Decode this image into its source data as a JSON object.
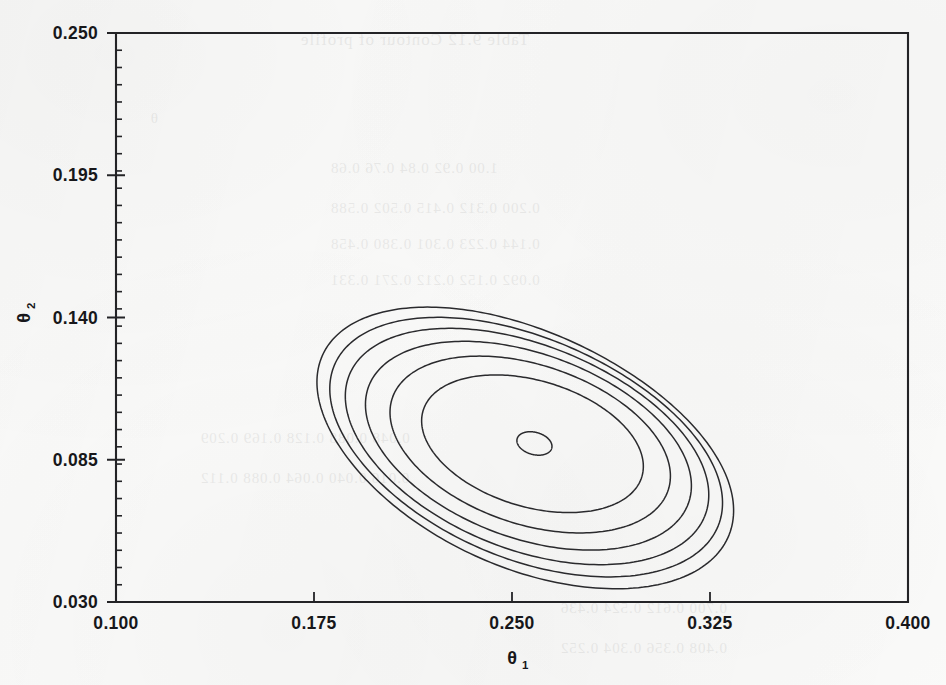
{
  "figure": {
    "kind": "contour-plot",
    "background_color": "#fbfbfa",
    "line_color": "#2a2a2d",
    "axis_color": "#232326"
  },
  "axes": {
    "x": {
      "title": "θ",
      "subscript": "1",
      "min": 0.1,
      "max": 0.4,
      "ticks": [
        "0.100",
        "0.175",
        "0.250",
        "0.325",
        "0.400"
      ],
      "tick_values": [
        0.1,
        0.175,
        0.25,
        0.325,
        0.4
      ],
      "minor_ticks": false
    },
    "y": {
      "title": "θ",
      "subscript": "2",
      "min": 0.03,
      "max": 0.25,
      "ticks": [
        "0.250",
        "0.195",
        "0.140",
        "0.085",
        "0.030"
      ],
      "tick_values": [
        0.25,
        0.195,
        0.14,
        0.085,
        0.03
      ],
      "minor_ticks": true,
      "minor_tick_count": 33
    }
  },
  "chart_data": {
    "type": "contour",
    "title": "",
    "xlabel": "θ₁",
    "ylabel": "θ₂",
    "xlim": [
      0.1,
      0.4
    ],
    "ylim": [
      0.03,
      0.25
    ],
    "grid": false,
    "legend": "none",
    "center": {
      "x": 0.258,
      "y": 0.091
    },
    "levels": [
      {
        "index": 1,
        "label": "innermost",
        "center": {
          "x": 0.2585,
          "y": 0.0913
        },
        "semi_axis_x": 0.0068,
        "semi_axis_y": 0.0043,
        "rotation_deg": -16,
        "skew": 0.0
      },
      {
        "index": 2,
        "center": {
          "x": 0.2565,
          "y": 0.092
        },
        "semi_axis_x": 0.043,
        "semi_axis_y": 0.0245,
        "rotation_deg": -16,
        "skew": 0.06
      },
      {
        "index": 3,
        "center": {
          "x": 0.2545,
          "y": 0.0925
        },
        "semi_axis_x": 0.0545,
        "semi_axis_y": 0.031,
        "rotation_deg": -17,
        "skew": 0.09
      },
      {
        "index": 4,
        "center": {
          "x": 0.2525,
          "y": 0.093
        },
        "semi_axis_x": 0.0635,
        "semi_axis_y": 0.036,
        "rotation_deg": -18,
        "skew": 0.12
      },
      {
        "index": 5,
        "center": {
          "x": 0.2505,
          "y": 0.0938
        },
        "semi_axis_x": 0.071,
        "semi_axis_y": 0.04,
        "rotation_deg": -19,
        "skew": 0.15
      },
      {
        "index": 6,
        "center": {
          "x": 0.249,
          "y": 0.0945
        },
        "semi_axis_x": 0.077,
        "semi_axis_y": 0.0432,
        "rotation_deg": -20,
        "skew": 0.17
      },
      {
        "index": 7,
        "label": "outermost",
        "center": {
          "x": 0.2475,
          "y": 0.0952
        },
        "semi_axis_x": 0.082,
        "semi_axis_y": 0.0462,
        "rotation_deg": -21,
        "skew": 0.19
      }
    ]
  },
  "bleed_through": {
    "lines": [
      {
        "text": "Table 9.12  Contour of profile",
        "x": 300,
        "y": 30,
        "size": 17
      },
      {
        "text": "θ",
        "x": 150,
        "y": 110,
        "size": 15
      },
      {
        "text": "1.00   0.92   0.84   0.76   0.68",
        "x": 330,
        "y": 160,
        "size": 15
      },
      {
        "text": "0.200  0.312  0.415  0.502  0.588",
        "x": 330,
        "y": 200,
        "size": 15
      },
      {
        "text": "0.144  0.223  0.301  0.380  0.458",
        "x": 330,
        "y": 236,
        "size": 15
      },
      {
        "text": "0.092  0.152  0.212  0.271  0.331",
        "x": 330,
        "y": 272,
        "size": 15
      },
      {
        "text": "0.048  0.088  0.128  0.169  0.209",
        "x": 200,
        "y": 430,
        "size": 15
      },
      {
        "text": "0.016  0.040  0.064  0.088  0.112",
        "x": 200,
        "y": 470,
        "size": 15
      },
      {
        "text": "0.700  0.612  0.524  0.436",
        "x": 560,
        "y": 600,
        "size": 15
      },
      {
        "text": "0.408  0.356  0.304  0.252",
        "x": 560,
        "y": 640,
        "size": 15
      }
    ]
  }
}
